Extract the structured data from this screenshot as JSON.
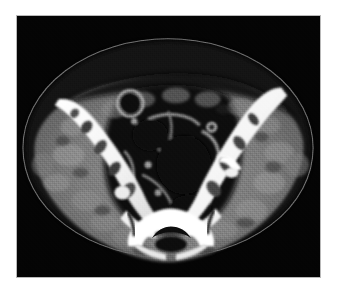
{
  "viewer": {
    "name": "ct-axial-pelvis-viewer",
    "modality": "CT",
    "plane": "axial",
    "region": "pelvis",
    "background_color": "#000000",
    "frame_color": "#b9b9b9",
    "page_background": "#ffffff",
    "image_rect": {
      "x": 16,
      "y": 15,
      "width": 305,
      "height": 263
    }
  },
  "windowing": {
    "soft_tissue_gray": "#8a8a8a",
    "muscle_gray": "#6f6f6f",
    "fat_gray": "#2a2a2a",
    "air_black": "#050505",
    "bone_white": "#ffffff",
    "skin_line_gray": "#9a9a9a"
  },
  "anatomy": {
    "skin_contour": {
      "label": "skin-contour",
      "description": "thin bright outer body-surface line, broad ellipse",
      "color": "#9d9d9d"
    },
    "subcutaneous_fat": {
      "label": "subcutaneous-fat",
      "description": "dark low-attenuation layer beneath the skin line",
      "color": "#242424"
    },
    "soft_tissue_body": {
      "label": "soft-tissue-body",
      "description": "mottled mid-gray gluteal and iliacus musculature",
      "color": "#7b7b7b"
    },
    "right_iliac_bone": {
      "label": "right-iliac-bone",
      "description": "bright obliquely oriented iliac wing, image left",
      "color": "#ffffff"
    },
    "left_iliac_bone": {
      "label": "left-iliac-bone",
      "description": "bright obliquely oriented iliac wing, image right",
      "color": "#ffffff"
    },
    "sacrum": {
      "label": "sacrum",
      "description": "central inferior bright vertebral segment with spinal canal",
      "color": "#ffffff"
    },
    "sacral_canal": {
      "label": "sacral-canal",
      "description": "dark arch-shaped canal within the sacrum",
      "color": "#101010"
    },
    "sacroiliac_joints": {
      "label": "sacroiliac-joints",
      "description": "thin dark clefts between sacrum and iliac bones",
      "color": "#1b1b1b"
    },
    "bowel_loops": {
      "label": "bowel-loops",
      "description": "central gas-filled dark loops with gray walls",
      "color": "#0a0a0a"
    },
    "bowel_ring": {
      "label": "bowel-ring-structure",
      "description": "round ring-shaped loop in anterior-left abdomen",
      "color": "#909090"
    },
    "bone_marrow": {
      "label": "bone-marrow-lucency",
      "description": "darker trabecular spaces inside cortical bone",
      "color": "#3a3a3a"
    }
  }
}
